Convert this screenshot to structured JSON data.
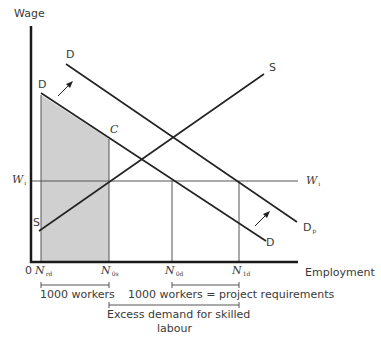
{
  "diagram": {
    "y_axis_label": "Wage",
    "x_axis_label": "Employment",
    "origin_label": "0",
    "curves": {
      "demand_original": "D",
      "demand_original_end": "D",
      "demand_shifted_start": "D",
      "demand_shifted_end": {
        "main": "D",
        "sub": "p"
      },
      "supply_start": "S",
      "supply_end": "S"
    },
    "wage_line": {
      "main": "W",
      "sub": "i"
    },
    "point_c": "C",
    "x_ticks": [
      {
        "main": "N",
        "sub": "rd"
      },
      {
        "main": "N",
        "sub": "0s"
      },
      {
        "main": "N",
        "sub": "0d"
      },
      {
        "main": "N",
        "sub": "1d"
      }
    ],
    "annotations": {
      "range1": "1000 workers",
      "range2": "1000 workers = project requirements",
      "excess_line1": "Excess demand for skilled",
      "excess_line2": "labour"
    },
    "colors": {
      "axis": "#1a1a1a",
      "curve": "#222222",
      "thin_line": "#555555",
      "shade": "#d0d0d0"
    }
  }
}
